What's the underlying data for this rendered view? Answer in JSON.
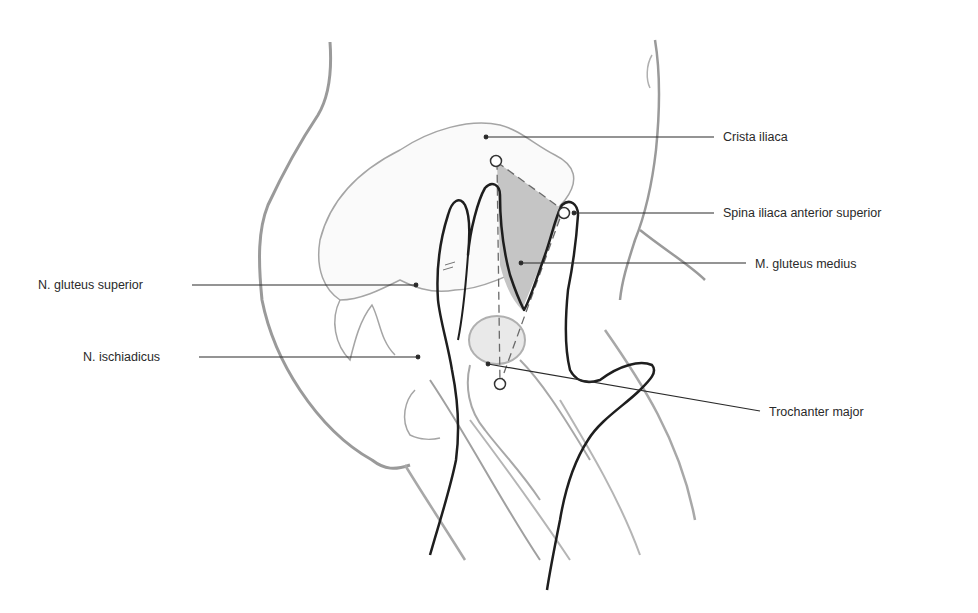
{
  "figure": {
    "type": "anatomical-illustration",
    "colors": {
      "background": "#ffffff",
      "outline_light": "#9a9a9a",
      "outline_dark": "#1e1e1e",
      "shade": "#c7c7c7",
      "leader_line": "#2a2a2a",
      "label_text": "#2a2a2a"
    }
  },
  "labels": {
    "crista_iliaca": "Crista iliaca",
    "spina_iliaca": "Spina iliaca anterior superior",
    "gluteus_medius": "M. gluteus medius",
    "gluteus_superior": "N. gluteus superior",
    "ischiadicus": "N. ischiadicus",
    "trochanter": "Trochanter major"
  },
  "landmarks": [
    {
      "name": "crista-iliaca-top-point",
      "x": 495,
      "y": 161
    },
    {
      "name": "spina-iliaca-point",
      "x": 564,
      "y": 213
    },
    {
      "name": "trochanter-point",
      "x": 500,
      "y": 384
    }
  ]
}
